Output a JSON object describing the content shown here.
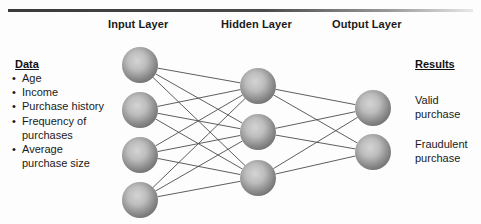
{
  "figure": {
    "background": "#fdfdfd",
    "rule_color": "#3a3a3a"
  },
  "layer_titles": {
    "input": "Input Layer",
    "hidden": "Hidden Layer",
    "output": "Output Layer"
  },
  "data_panel": {
    "heading": "Data",
    "items": [
      "Age",
      "Income",
      "Purchase history",
      "Frequency of purchases",
      "Average purchase size"
    ]
  },
  "results_panel": {
    "heading": "Results",
    "items": [
      "Valid purchase",
      "Fraudulent purchase"
    ]
  },
  "network": {
    "node_fill_center": "#c9c9c9",
    "node_fill_edge": "#6b6b6b",
    "edge_color": "#4c4c4c",
    "node_radius": 18,
    "layers": [
      {
        "name": "input",
        "x": 140,
        "nodes": [
          {
            "cx": 140,
            "cy": 65
          },
          {
            "cx": 140,
            "cy": 110
          },
          {
            "cx": 140,
            "cy": 155
          },
          {
            "cx": 140,
            "cy": 200
          }
        ]
      },
      {
        "name": "hidden",
        "x": 258,
        "nodes": [
          {
            "cx": 258,
            "cy": 86
          },
          {
            "cx": 258,
            "cy": 132
          },
          {
            "cx": 258,
            "cy": 178
          }
        ]
      },
      {
        "name": "output",
        "x": 373,
        "nodes": [
          {
            "cx": 373,
            "cy": 108
          },
          {
            "cx": 373,
            "cy": 152
          }
        ]
      }
    ],
    "connections": [
      {
        "from_layer": 0,
        "to_layer": 1,
        "fully_connected": true,
        "count": 12
      },
      {
        "from_layer": 1,
        "to_layer": 2,
        "fully_connected": true,
        "count": 6
      }
    ]
  }
}
